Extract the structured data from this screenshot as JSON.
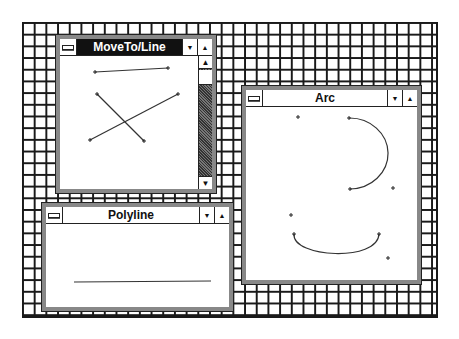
{
  "desktop": {
    "pattern": "grid",
    "line_color": "#1a1a1a",
    "background": "#ffffff"
  },
  "windows": [
    {
      "id": "moveto-line",
      "title": "MoveTo/Line",
      "active": true,
      "controls": {
        "minimize": "▼",
        "maximize": "▲"
      },
      "scrollbar": {
        "up": "🡅",
        "down": "🡇"
      },
      "lines": [
        {
          "x1": 95,
          "y1": 72,
          "x2": 168,
          "y2": 68
        },
        {
          "x1": 97,
          "y1": 94,
          "x2": 144,
          "y2": 141
        },
        {
          "x1": 178,
          "y1": 94,
          "x2": 90,
          "y2": 140
        }
      ]
    },
    {
      "id": "arc",
      "title": "Arc",
      "active": false,
      "controls": {
        "minimize": "▼",
        "maximize": "▲"
      },
      "points": [
        {
          "x": 298,
          "y": 117
        },
        {
          "x": 393,
          "y": 188
        },
        {
          "x": 291,
          "y": 215
        },
        {
          "x": 388,
          "y": 258
        }
      ],
      "arcs": [
        {
          "path": "M 349 118 A 38 35 0 0 1 350 189"
        },
        {
          "path": "M 294 234 C 292 258, 378 262, 379 234"
        }
      ],
      "arc_endpoints": [
        {
          "x": 349,
          "y": 118
        },
        {
          "x": 350,
          "y": 189
        },
        {
          "x": 294,
          "y": 234
        },
        {
          "x": 379,
          "y": 234
        }
      ]
    },
    {
      "id": "polyline",
      "title": "Polyline",
      "active": false,
      "controls": {
        "minimize": "▼",
        "maximize": "▲"
      },
      "lines": [
        {
          "x1": 74,
          "y1": 282,
          "x2": 211,
          "y2": 281
        }
      ]
    }
  ]
}
